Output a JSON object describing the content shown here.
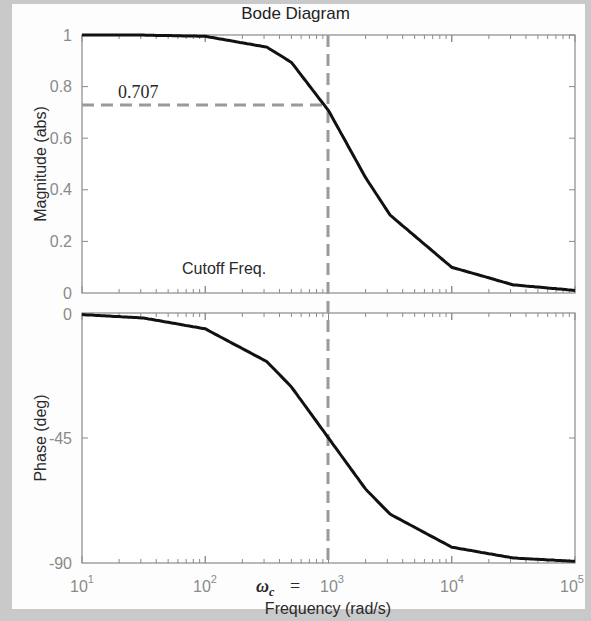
{
  "chart_data": [
    {
      "type": "line",
      "title": "Bode Diagram",
      "panel": "magnitude",
      "xlabel": "Frequency  (rad/s)",
      "ylabel": "Magnitude (abs)",
      "xscale": "log",
      "xlim": [
        10,
        100000
      ],
      "ylim": [
        0,
        1
      ],
      "yticks": [
        "0",
        "0.2",
        "0.4",
        "0.6",
        "0.8",
        "1"
      ],
      "x": [
        10,
        31.6,
        100,
        316,
        500,
        1000,
        2000,
        3160,
        10000,
        31600,
        100000
      ],
      "values": [
        1.0,
        0.9995,
        0.995,
        0.953,
        0.894,
        0.707,
        0.447,
        0.302,
        0.0995,
        0.0316,
        0.01
      ],
      "annotations": [
        {
          "text": "0.707",
          "type": "hline-dashed",
          "y": 0.707,
          "x_end": 1000
        },
        {
          "text": "Cutoff Freq.",
          "type": "vline-dashed",
          "x": 1000
        }
      ]
    },
    {
      "type": "line",
      "panel": "phase",
      "ylabel": "Phase (deg)",
      "xscale": "log",
      "xlim": [
        10,
        100000
      ],
      "ylim": [
        -90,
        0
      ],
      "yticks": [
        "0",
        "-45",
        "-90"
      ],
      "x": [
        10,
        31.6,
        100,
        316,
        500,
        1000,
        2000,
        3160,
        10000,
        31600,
        100000
      ],
      "values": [
        -0.57,
        -1.8,
        -5.7,
        -17.5,
        -26.6,
        -45,
        -63.4,
        -72.4,
        -84.3,
        -88.2,
        -89.4
      ],
      "annotations": [
        {
          "text": "ωc = 10^3",
          "type": "vline-dashed",
          "x": 1000
        }
      ]
    }
  ],
  "figure": {
    "title": "Bode Diagram",
    "mag_ylabel": "Magnitude (abs)",
    "phase_ylabel": "Phase (deg)",
    "xlabel": "Frequency  (rad/s)",
    "label_0707": "0.707",
    "label_cutoff": "Cutoff Freq.",
    "label_wc": "ω",
    "label_wc_sub": "c",
    "label_eq": "=",
    "mag_ticks": [
      "0",
      "0.2",
      "0.4",
      "0.6",
      "0.8",
      "1"
    ],
    "phase_ticks": [
      "0",
      "-45",
      "-90"
    ],
    "x_ticks_base": [
      "10",
      "10",
      "10",
      "10",
      "10"
    ],
    "x_ticks_exp": [
      "1",
      "2",
      "3",
      "4",
      "5"
    ]
  }
}
